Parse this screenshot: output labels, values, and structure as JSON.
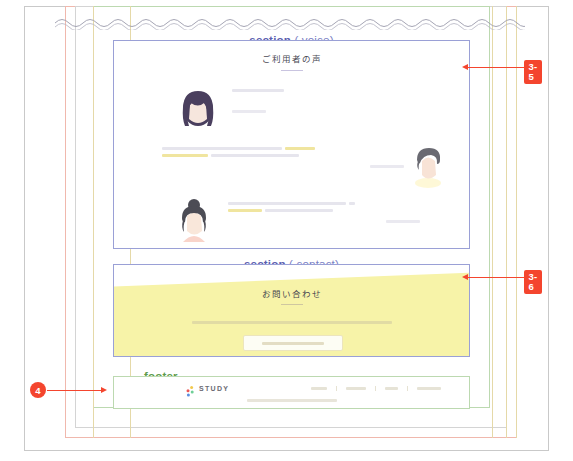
{
  "document": {
    "kind": "web-design-annotation-sheet",
    "page_background": "#ffffff"
  },
  "colors": {
    "section_label": "#5b5fb0",
    "footer_label": "#5e9c4c",
    "annotation": "#f4452e",
    "contact_fill": "#f7f3a8",
    "highlight": "#efe49a",
    "frame_pink": "#f0b8ad",
    "frame_green": "#bcd9b0",
    "frame_grey": "#d4d4d4"
  },
  "sections": {
    "voice": {
      "label_text": "section",
      "label_selector": "(.voice)",
      "heading": "ご利用者の声",
      "testimonials": [
        {
          "avatar": "woman-long-dark-purple-hair-avatar",
          "avatar_side": "left",
          "lines": 2,
          "name_placeholder": true
        },
        {
          "avatar": "man-short-dark-hair-avatar",
          "avatar_side": "right",
          "lines": 2,
          "name_placeholder": true
        },
        {
          "avatar": "woman-bun-hair-avatar",
          "avatar_side": "left",
          "lines": 2,
          "name_placeholder": true
        }
      ]
    },
    "contact": {
      "label_text": "section",
      "label_selector": "(.contact)",
      "heading": "お問い合わせ",
      "description_placeholder": true,
      "button_placeholder": true
    },
    "footer": {
      "label_text": "footer",
      "logo_text": "STUDY",
      "logo_mark": "dots-logo-icon",
      "nav_item_count": 4,
      "copyright_placeholder": true
    }
  },
  "annotations": [
    {
      "id": "ann-3-5",
      "label": "3-5",
      "shape": "square",
      "points_to": "voice-section",
      "arrow": "left"
    },
    {
      "id": "ann-3-6",
      "label": "3-6",
      "shape": "square",
      "points_to": "contact-section",
      "arrow": "left"
    },
    {
      "id": "ann-4",
      "label": "4",
      "shape": "circle",
      "points_to": "footer-section",
      "arrow": "right"
    }
  ]
}
